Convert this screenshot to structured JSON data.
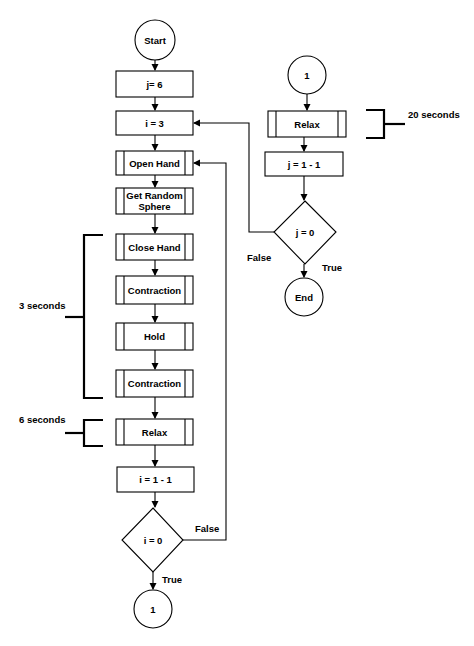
{
  "diagram": {
    "type": "flowchart",
    "left_flow": {
      "start": "Start",
      "j_init": "j= 6",
      "i_init": "i = 3",
      "open_hand": "Open Hand",
      "get_random_sphere_line1": "Get Random",
      "get_random_sphere_line2": "Sphere",
      "close_hand": "Close Hand",
      "contraction_1": "Contraction",
      "hold": "Hold",
      "contraction_2": "Contraction",
      "relax": "Relax",
      "i_decrement": "i = 1 - 1",
      "i_check": "i = 0",
      "i_check_false": "False",
      "i_check_true": "True",
      "connector_out": "1"
    },
    "right_flow": {
      "connector_in": "1",
      "relax": "Relax",
      "j_decrement": "j = 1 - 1",
      "j_check": "j = 0",
      "j_check_false": "False",
      "j_check_true": "True",
      "end": "End"
    },
    "annotations": {
      "three_seconds": "3 seconds",
      "six_seconds": "6 seconds",
      "twenty_seconds": "20 seconds"
    }
  }
}
